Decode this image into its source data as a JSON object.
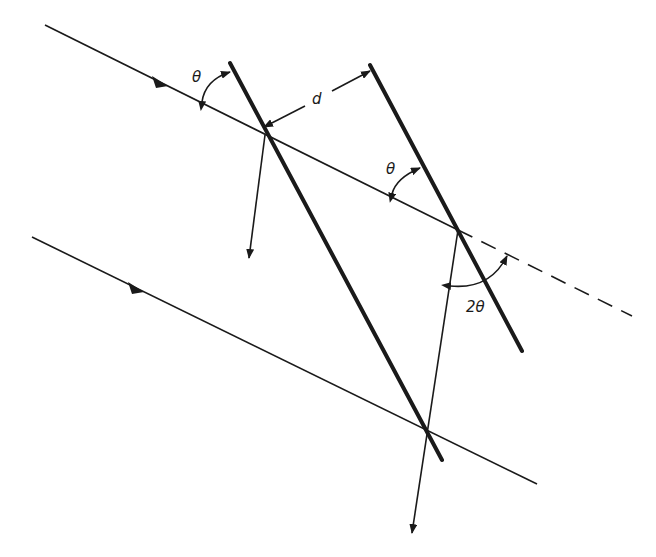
{
  "diagram": {
    "title": "",
    "labels": {
      "theta_upper": "θ",
      "theta_middle": "θ",
      "spacing": "d",
      "deflection": "2θ"
    },
    "elements": {
      "incident_rays": 2,
      "lattice_planes": 2,
      "reflected_rays": 2,
      "continuation": "dashed"
    },
    "colors": {
      "line": "#1a1a1a",
      "background": "#ffffff"
    }
  }
}
